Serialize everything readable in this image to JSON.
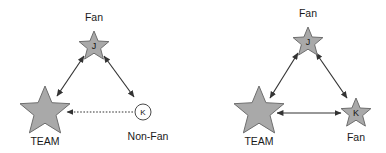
{
  "figure": {
    "background_color": "#ffffff",
    "star_fill_color": "#a9a9a9",
    "star_stroke_color": "#6e6e6e",
    "edge_color": "#333333",
    "label_color": "#1a1a1a"
  },
  "diagrams": [
    {
      "id": "left-diagram",
      "nodes": [
        {
          "id": "left-top",
          "shape": "star",
          "letter": "J",
          "label": "Fan",
          "label_position": "above",
          "size": "small"
        },
        {
          "id": "left-team",
          "shape": "star",
          "letter": "",
          "label": "TEAM",
          "label_position": "below",
          "size": "large"
        },
        {
          "id": "left-nonfan",
          "shape": "circle",
          "letter": "K",
          "label": "Non-Fan",
          "label_position": "below",
          "size": "small"
        }
      ],
      "edges": [
        {
          "id": "left-edge-j-team",
          "from": "left-top",
          "to": "left-team",
          "style": "solid",
          "arrows": "both"
        },
        {
          "id": "left-edge-j-k",
          "from": "left-top",
          "to": "left-nonfan",
          "style": "solid",
          "arrows": "both"
        },
        {
          "id": "left-edge-k-team",
          "from": "left-nonfan",
          "to": "left-team",
          "style": "dotted",
          "arrows": "to-team"
        }
      ]
    },
    {
      "id": "right-diagram",
      "nodes": [
        {
          "id": "right-top",
          "shape": "star",
          "letter": "J",
          "label": "Fan",
          "label_position": "above",
          "size": "small"
        },
        {
          "id": "right-team",
          "shape": "star",
          "letter": "",
          "label": "TEAM",
          "label_position": "below",
          "size": "large"
        },
        {
          "id": "right-fan-k",
          "shape": "star",
          "letter": "K",
          "label": "Fan",
          "label_position": "below",
          "size": "small"
        }
      ],
      "edges": [
        {
          "id": "right-edge-j-team",
          "from": "right-top",
          "to": "right-team",
          "style": "solid",
          "arrows": "both"
        },
        {
          "id": "right-edge-j-k",
          "from": "right-top",
          "to": "right-fan-k",
          "style": "solid",
          "arrows": "both"
        },
        {
          "id": "right-edge-k-team",
          "from": "right-fan-k",
          "to": "right-team",
          "style": "solid",
          "arrows": "both"
        }
      ]
    }
  ],
  "labels": {
    "left_top_fan": "Fan",
    "left_top_letter": "J",
    "left_team": "TEAM",
    "left_nonfan": "Non-Fan",
    "left_nonfan_letter": "K",
    "right_top_fan": "Fan",
    "right_top_letter": "J",
    "right_team": "TEAM",
    "right_fan": "Fan",
    "right_fan_letter": "K"
  }
}
